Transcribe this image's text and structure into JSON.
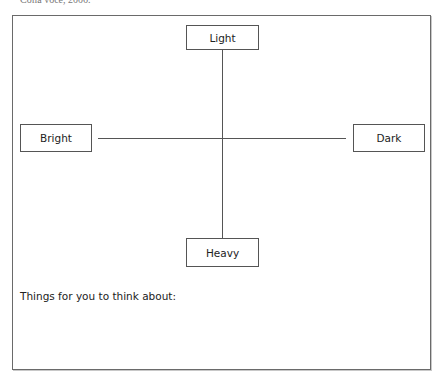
{
  "caption": "Colla voce, 2006.",
  "diagram": {
    "type": "axis-cross",
    "nodes": {
      "top": "Light",
      "left": "Bright",
      "right": "Dark",
      "bottom": "Heavy"
    }
  },
  "prompt": "Things for you to think about:",
  "colors": {
    "line": "#555555",
    "frame": "#6a6a6a",
    "text": "#222222"
  }
}
